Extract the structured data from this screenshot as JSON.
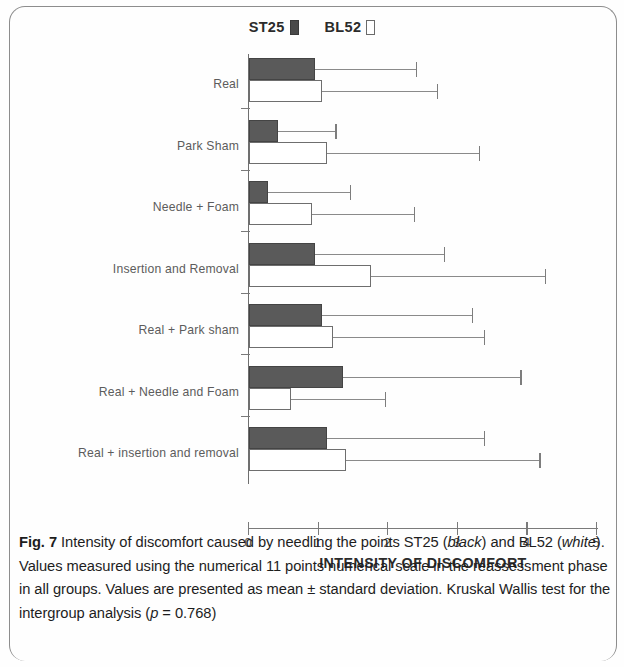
{
  "figure": {
    "axis_title": "INTENSITY OF DISCOMFORT",
    "legend": [
      {
        "label": "ST25",
        "swatch": "filled-square-icon",
        "color": "#4a4a4a"
      },
      {
        "label": "BL52",
        "swatch": "hollow-square-icon",
        "color": "#ffffff"
      }
    ],
    "caption": {
      "fig_no": "Fig. 7",
      "line1_a": " Intensity of discomfort caused by needling the points ST25 (",
      "italic1": "black",
      "line1_b": ") and BL52 (",
      "italic2": "white",
      "line1_c": "). Values measured using the numerical 11 points numerical scale in the reassessment phase in all groups. Values are presented as mean ± standard deviation. Kruskal Wallis test for the intergroup analysis (",
      "italic3": "p",
      "line1_d": " = 0.768)"
    }
  },
  "chart_data": {
    "type": "bar",
    "orientation": "horizontal",
    "title": "Intensity of discomfort caused by needling the points ST25 (black) and BL52 (white)",
    "xlabel": "INTENSITY OF DISCOMFORT",
    "ylabel": "",
    "xlim": [
      0,
      5
    ],
    "xticks": [
      0,
      1,
      2,
      3,
      4,
      5
    ],
    "xtick_labels": [
      "0",
      "1",
      "2",
      "3",
      "4",
      "5"
    ],
    "grid": false,
    "legend_position": "top-center",
    "error_bars": "standard deviation (upper only)",
    "categories": [
      "Real",
      "Park Sham",
      "Needle + Foam",
      "Insertion and Removal",
      "Real + Park sham",
      "Real + Needle and Foam",
      "Real + insertion and removal"
    ],
    "series": [
      {
        "name": "ST25",
        "color": "#4a4a4a",
        "values": [
          0.95,
          0.42,
          0.28,
          0.95,
          1.05,
          1.35,
          1.12
        ],
        "errors": [
          1.45,
          0.82,
          1.17,
          1.85,
          2.15,
          2.55,
          2.25
        ],
        "upper_bounds": [
          2.4,
          1.24,
          1.45,
          2.8,
          3.2,
          3.9,
          3.37
        ]
      },
      {
        "name": "BL52",
        "color": "#ffffff",
        "values": [
          1.05,
          1.12,
          0.9,
          1.75,
          1.2,
          0.6,
          1.4
        ],
        "errors": [
          1.65,
          2.18,
          1.47,
          2.5,
          2.17,
          1.35,
          2.77
        ],
        "upper_bounds": [
          2.7,
          3.3,
          2.37,
          4.25,
          3.37,
          1.95,
          4.17
        ]
      }
    ]
  }
}
